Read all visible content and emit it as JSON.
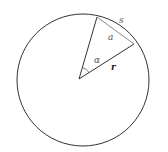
{
  "diagram": {
    "labels": {
      "arc": "s",
      "chord": "a",
      "angle": "α",
      "radius": "r"
    },
    "colors": {
      "stroke": "#333333",
      "chord": "#8a8a8a",
      "label": "#555555"
    }
  }
}
